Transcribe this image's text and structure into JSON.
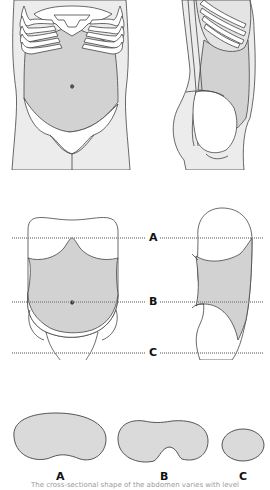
{
  "figure": {
    "top_views": {
      "front_label": "",
      "side_label": ""
    },
    "levels": {
      "a": "A",
      "b": "B",
      "c": "C"
    },
    "cross_sections": [
      {
        "label": "A",
        "shape": "kidney"
      },
      {
        "label": "B",
        "shape": "notched-kidney"
      },
      {
        "label": "C",
        "shape": "oval"
      }
    ],
    "caption": "The cross-sectional shape of the abdomen varies with level",
    "colors": {
      "outline": "#444444",
      "skin_fill": "#ececec",
      "abdomen_fill": "#d2d2d2",
      "section_fill": "#dadada",
      "white": "#ffffff",
      "dotted_line": "#8a8a8a"
    }
  }
}
